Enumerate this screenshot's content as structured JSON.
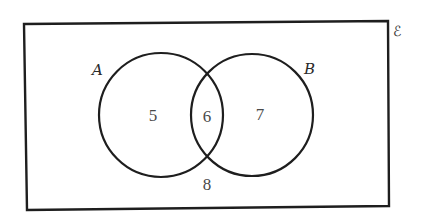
{
  "diagram": {
    "type": "venn",
    "universe": {
      "label": "ℰ",
      "corners": {
        "top_left": [
          24,
          24
        ],
        "top_right": [
          388,
          21
        ],
        "bottom_right": [
          389,
          206
        ],
        "bottom_left": [
          27,
          210
        ]
      }
    },
    "sets": [
      {
        "id": "A",
        "label": "A",
        "cx": 161,
        "cy": 115,
        "r": 62,
        "label_pos": [
          98,
          75
        ]
      },
      {
        "id": "B",
        "label": "B",
        "cx": 252,
        "cy": 115,
        "r": 61,
        "label_pos": [
          310,
          74
        ]
      }
    ],
    "regions": [
      {
        "name": "A only",
        "value": "5",
        "pos": [
          153,
          121
        ]
      },
      {
        "name": "A and B",
        "value": "6",
        "pos": [
          207,
          122
        ]
      },
      {
        "name": "B only",
        "value": "7",
        "pos": [
          260,
          120
        ]
      },
      {
        "name": "neither",
        "value": "8",
        "pos": [
          207,
          190
        ]
      }
    ],
    "colors": {
      "stroke": "#1e1e1e",
      "text": "#4a4a4a",
      "background": "#ffffff"
    }
  }
}
